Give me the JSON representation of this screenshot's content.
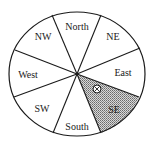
{
  "diagram": {
    "type": "compass-sector-wheel",
    "center": [
      77,
      74
    ],
    "radius_x": 68,
    "radius_y": 62,
    "sectors": [
      {
        "label": "North",
        "x": 77,
        "y": 30,
        "shaded": false
      },
      {
        "label": "NE",
        "x": 113,
        "y": 40,
        "shaded": false
      },
      {
        "label": "East",
        "x": 123,
        "y": 76,
        "shaded": false
      },
      {
        "label": "SE",
        "x": 114,
        "y": 113,
        "shaded": true
      },
      {
        "label": "South",
        "x": 77,
        "y": 130,
        "shaded": false
      },
      {
        "label": "SW",
        "x": 42,
        "y": 112,
        "shaded": false
      },
      {
        "label": "West",
        "x": 28,
        "y": 78,
        "shaded": false
      },
      {
        "label": "NW",
        "x": 43,
        "y": 40,
        "shaded": false
      }
    ],
    "marker": {
      "symbol": "circled-x",
      "x": 97,
      "y": 89
    },
    "shade_color": "#9a9a9a",
    "line_color": "#1a1a1a"
  }
}
